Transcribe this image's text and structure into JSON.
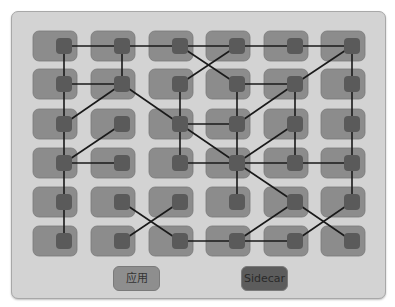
{
  "diagram": {
    "title": "",
    "colors": {
      "panel": "#d3d3d3",
      "app_box": "#8c8c8c",
      "sidecar_node": "#5a5a5a",
      "edge": "#1a1a1a"
    },
    "grid": {
      "rows": 6,
      "cols": 6,
      "col_centers": [
        64,
        122,
        180,
        237,
        295,
        352
      ],
      "row_centers": [
        46,
        84,
        124,
        163,
        202,
        241
      ]
    },
    "edges": [
      [
        [
          0,
          0
        ],
        [
          0,
          1
        ]
      ],
      [
        [
          0,
          1
        ],
        [
          0,
          2
        ]
      ],
      [
        [
          0,
          2
        ],
        [
          0,
          3
        ]
      ],
      [
        [
          0,
          3
        ],
        [
          0,
          4
        ]
      ],
      [
        [
          0,
          4
        ],
        [
          0,
          5
        ]
      ],
      [
        [
          0,
          0
        ],
        [
          1,
          0
        ]
      ],
      [
        [
          0,
          1
        ],
        [
          1,
          1
        ]
      ],
      [
        [
          0,
          2
        ],
        [
          1,
          3
        ]
      ],
      [
        [
          0,
          3
        ],
        [
          1,
          2
        ]
      ],
      [
        [
          0,
          5
        ],
        [
          1,
          4
        ]
      ],
      [
        [
          0,
          5
        ],
        [
          1,
          5
        ]
      ],
      [
        [
          1,
          0
        ],
        [
          1,
          1
        ]
      ],
      [
        [
          1,
          0
        ],
        [
          2,
          0
        ]
      ],
      [
        [
          1,
          1
        ],
        [
          2,
          0
        ]
      ],
      [
        [
          1,
          1
        ],
        [
          2,
          2
        ]
      ],
      [
        [
          1,
          2
        ],
        [
          2,
          2
        ]
      ],
      [
        [
          1,
          3
        ],
        [
          1,
          4
        ]
      ],
      [
        [
          1,
          3
        ],
        [
          2,
          3
        ]
      ],
      [
        [
          1,
          4
        ],
        [
          2,
          3
        ]
      ],
      [
        [
          1,
          4
        ],
        [
          2,
          4
        ]
      ],
      [
        [
          1,
          5
        ],
        [
          2,
          5
        ]
      ],
      [
        [
          2,
          0
        ],
        [
          3,
          0
        ]
      ],
      [
        [
          2,
          1
        ],
        [
          3,
          0
        ]
      ],
      [
        [
          2,
          2
        ],
        [
          2,
          3
        ]
      ],
      [
        [
          2,
          2
        ],
        [
          3,
          2
        ]
      ],
      [
        [
          2,
          2
        ],
        [
          3,
          3
        ]
      ],
      [
        [
          2,
          3
        ],
        [
          3,
          3
        ]
      ],
      [
        [
          2,
          4
        ],
        [
          3,
          3
        ]
      ],
      [
        [
          2,
          4
        ],
        [
          3,
          4
        ]
      ],
      [
        [
          2,
          5
        ],
        [
          3,
          5
        ]
      ],
      [
        [
          3,
          0
        ],
        [
          3,
          1
        ]
      ],
      [
        [
          3,
          0
        ],
        [
          4,
          0
        ]
      ],
      [
        [
          3,
          2
        ],
        [
          3,
          3
        ]
      ],
      [
        [
          3,
          3
        ],
        [
          3,
          4
        ]
      ],
      [
        [
          3,
          4
        ],
        [
          3,
          5
        ]
      ],
      [
        [
          3,
          3
        ],
        [
          4,
          3
        ]
      ],
      [
        [
          3,
          3
        ],
        [
          4,
          4
        ]
      ],
      [
        [
          3,
          5
        ],
        [
          4,
          5
        ]
      ],
      [
        [
          4,
          0
        ],
        [
          5,
          0
        ]
      ],
      [
        [
          4,
          1
        ],
        [
          5,
          2
        ]
      ],
      [
        [
          4,
          2
        ],
        [
          5,
          1
        ]
      ],
      [
        [
          4,
          4
        ],
        [
          5,
          3
        ]
      ],
      [
        [
          4,
          4
        ],
        [
          5,
          5
        ]
      ],
      [
        [
          4,
          5
        ],
        [
          5,
          4
        ]
      ],
      [
        [
          5,
          2
        ],
        [
          5,
          3
        ]
      ],
      [
        [
          5,
          3
        ],
        [
          5,
          4
        ]
      ]
    ]
  },
  "legend": {
    "app_label": "应用",
    "sidecar_label": "Sidecar"
  }
}
